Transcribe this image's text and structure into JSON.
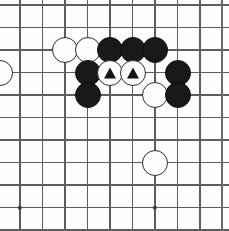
{
  "board": {
    "title": "Go board position diagram",
    "width_px": 229,
    "height_px": 231,
    "grid": {
      "spacing_px": 22.5,
      "origin_x": 20,
      "origin_y": 5,
      "columns": 10,
      "rows": 10,
      "line_color": "#5d5d5d",
      "edge_color": "#6b6b6b",
      "background_color": "#fdfdfb",
      "x_positions": [
        20,
        42.5,
        65,
        87.5,
        110,
        132.5,
        155,
        177.5,
        200,
        222
      ],
      "y_positions": [
        5,
        27.5,
        50,
        72.5,
        95,
        117.5,
        140,
        162.5,
        185,
        207.5,
        230
      ]
    },
    "star_points": [
      {
        "name": "hoshi-left",
        "x": 20,
        "y": 207.5
      },
      {
        "name": "hoshi-right",
        "x": 155,
        "y": 207.5
      }
    ],
    "stone_colors": {
      "black": "#191919",
      "white": "#fdfdfd",
      "white_outline": "#2e2e2e",
      "marker": "#141414"
    },
    "stone_diameter_px": 26,
    "stones": [
      {
        "id": "w-a",
        "color": "white",
        "x": 0,
        "y": 72.5,
        "marker": "none",
        "label": "white-stone-left-edge"
      },
      {
        "id": "w-b",
        "color": "white",
        "x": 65,
        "y": 50,
        "marker": "none",
        "label": "white-stone"
      },
      {
        "id": "w-c",
        "color": "white",
        "x": 87.5,
        "y": 50,
        "marker": "none",
        "label": "white-stone"
      },
      {
        "id": "b-a",
        "color": "black",
        "x": 110,
        "y": 50,
        "marker": "none",
        "label": "black-stone"
      },
      {
        "id": "b-b",
        "color": "black",
        "x": 132.5,
        "y": 50,
        "marker": "none",
        "label": "black-stone"
      },
      {
        "id": "b-c",
        "color": "black",
        "x": 155,
        "y": 50,
        "marker": "none",
        "label": "black-stone"
      },
      {
        "id": "b-d",
        "color": "black",
        "x": 87.5,
        "y": 72.5,
        "marker": "none",
        "label": "black-stone"
      },
      {
        "id": "w-d",
        "color": "white",
        "x": 110,
        "y": 72.5,
        "marker": "triangle",
        "label": "white-stone-marked"
      },
      {
        "id": "w-e",
        "color": "white",
        "x": 132.5,
        "y": 72.5,
        "marker": "triangle",
        "label": "white-stone-marked"
      },
      {
        "id": "b-e",
        "color": "black",
        "x": 177.5,
        "y": 72.5,
        "marker": "none",
        "label": "black-stone"
      },
      {
        "id": "b-f",
        "color": "black",
        "x": 87.5,
        "y": 95,
        "marker": "none",
        "label": "black-stone"
      },
      {
        "id": "w-f",
        "color": "white",
        "x": 155,
        "y": 95,
        "marker": "none",
        "label": "white-stone"
      },
      {
        "id": "b-g",
        "color": "black",
        "x": 177.5,
        "y": 95,
        "marker": "none",
        "label": "black-stone"
      },
      {
        "id": "w-g",
        "color": "white",
        "x": 155,
        "y": 162.5,
        "marker": "none",
        "label": "white-stone"
      }
    ]
  }
}
